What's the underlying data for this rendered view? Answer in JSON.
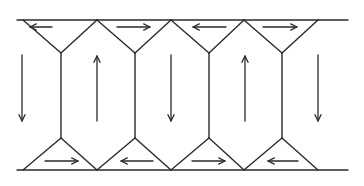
{
  "diagram": {
    "title": "",
    "colors": {
      "line": "#2a2a2a",
      "background": "#ffffff"
    },
    "boundaries": {
      "top": {
        "y": 20,
        "x1": 17,
        "x2": 348
      },
      "bottom": {
        "y": 170,
        "x1": 17,
        "x2": 348
      }
    },
    "top_apices_x": [
      23,
      97,
      171,
      244,
      318
    ],
    "vertical_edges_x": [
      61,
      135,
      209,
      282
    ],
    "vertex_y": {
      "upper": 53,
      "lower": 138
    },
    "top_triangle_arrows": [
      {
        "x1": 52,
        "x2": 30,
        "y": 27,
        "direction": "left"
      },
      {
        "x1": 117,
        "x2": 150,
        "y": 27,
        "direction": "right"
      },
      {
        "x1": 226,
        "x2": 193,
        "y": 27,
        "direction": "left"
      },
      {
        "x1": 263,
        "x2": 297,
        "y": 27,
        "direction": "right"
      }
    ],
    "bottom_triangle_arrows": [
      {
        "x1": 45,
        "x2": 78,
        "y": 161,
        "direction": "right"
      },
      {
        "x1": 153,
        "x2": 121,
        "y": 161,
        "direction": "left"
      },
      {
        "x1": 192,
        "x2": 225,
        "y": 161,
        "direction": "right"
      },
      {
        "x1": 298,
        "x2": 268,
        "y": 161,
        "direction": "left"
      }
    ],
    "cell_arrows": [
      {
        "x": 22,
        "y1": 55,
        "y2": 121,
        "direction": "down"
      },
      {
        "x": 97,
        "y1": 121,
        "y2": 56,
        "direction": "up"
      },
      {
        "x": 171,
        "y1": 55,
        "y2": 121,
        "direction": "down"
      },
      {
        "x": 245,
        "y1": 121,
        "y2": 56,
        "direction": "up"
      },
      {
        "x": 318,
        "y1": 55,
        "y2": 121,
        "direction": "down"
      }
    ]
  }
}
